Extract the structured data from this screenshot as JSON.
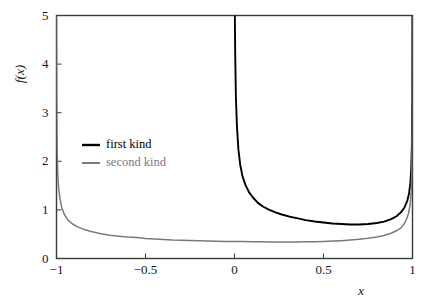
{
  "chart_data": {
    "type": "line",
    "title": "",
    "xlabel": "x",
    "ylabel": "f(x)",
    "xlim": [
      -1,
      1
    ],
    "ylim": [
      0,
      5
    ],
    "xticks": [
      "-1",
      "-0.5",
      "0",
      "0.5",
      "1"
    ],
    "xtick_values": [
      -1,
      -0.5,
      0,
      0.5,
      1
    ],
    "yticks": [
      "0",
      "1",
      "2",
      "3",
      "4",
      "5"
    ],
    "ytick_values": [
      0,
      1,
      2,
      3,
      4,
      5
    ],
    "grid": false,
    "legend_position": "center-left",
    "series": [
      {
        "name": "first kind",
        "color": "#000000",
        "domain": [
          0,
          1
        ],
        "note": "vertical asymptote at x=0 and x=1, minimum about 0.63 near x=0.5",
        "x": [
          0.002,
          0.004,
          0.008,
          0.014,
          0.022,
          0.032,
          0.045,
          0.062,
          0.082,
          0.105,
          0.13,
          0.16,
          0.19,
          0.23,
          0.27,
          0.31,
          0.35,
          0.4,
          0.45,
          0.5,
          0.55,
          0.6,
          0.65,
          0.7,
          0.75,
          0.8,
          0.84,
          0.88,
          0.91,
          0.935,
          0.955,
          0.97,
          0.98,
          0.988,
          0.993,
          0.9965,
          0.9985,
          0.9995
        ],
        "y": [
          5.0,
          4.2,
          3.3,
          2.7,
          2.24,
          1.93,
          1.69,
          1.51,
          1.36,
          1.25,
          1.15,
          1.07,
          1.01,
          0.95,
          0.9,
          0.86,
          0.83,
          0.79,
          0.76,
          0.74,
          0.72,
          0.71,
          0.7,
          0.7,
          0.71,
          0.73,
          0.76,
          0.81,
          0.87,
          0.95,
          1.05,
          1.18,
          1.33,
          1.55,
          1.85,
          2.35,
          3.3,
          5.0
        ]
      },
      {
        "name": "second kind",
        "color": "#7a7a7a",
        "domain": [
          -1,
          1
        ],
        "note": "vertical asymptote at x=-1 and x=1, minimum about 0.33 near x=0.3",
        "x": [
          -0.9995,
          -0.9985,
          -0.9965,
          -0.993,
          -0.988,
          -0.98,
          -0.97,
          -0.955,
          -0.935,
          -0.91,
          -0.88,
          -0.84,
          -0.8,
          -0.75,
          -0.7,
          -0.65,
          -0.6,
          -0.55,
          -0.5,
          -0.45,
          -0.4,
          -0.35,
          -0.3,
          -0.25,
          -0.2,
          -0.15,
          -0.1,
          -0.05,
          0.0,
          0.05,
          0.1,
          0.15,
          0.2,
          0.25,
          0.3,
          0.35,
          0.4,
          0.45,
          0.5,
          0.55,
          0.6,
          0.65,
          0.7,
          0.75,
          0.8,
          0.84,
          0.88,
          0.91,
          0.935,
          0.955,
          0.97,
          0.98,
          0.988,
          0.993,
          0.9965,
          0.9985,
          0.9995
        ],
        "y": [
          5.0,
          3.3,
          2.3,
          1.75,
          1.45,
          1.22,
          1.04,
          0.9,
          0.79,
          0.71,
          0.65,
          0.59,
          0.55,
          0.51,
          0.48,
          0.46,
          0.44,
          0.43,
          0.41,
          0.4,
          0.39,
          0.38,
          0.375,
          0.37,
          0.365,
          0.36,
          0.355,
          0.352,
          0.35,
          0.348,
          0.345,
          0.343,
          0.342,
          0.341,
          0.341,
          0.342,
          0.344,
          0.347,
          0.352,
          0.358,
          0.367,
          0.379,
          0.394,
          0.415,
          0.443,
          0.475,
          0.52,
          0.57,
          0.63,
          0.72,
          0.84,
          0.96,
          1.15,
          1.4,
          1.85,
          2.8,
          5.0
        ]
      }
    ]
  },
  "axes": {
    "ylabel_text": "f(x)",
    "xlabel_text": "x"
  },
  "legend": {
    "entries": [
      {
        "label": "first kind",
        "color": "#000000"
      },
      {
        "label": "second kind",
        "color": "#7a7a7a"
      }
    ]
  },
  "style": {
    "frame_color": "#3a3a3a",
    "background": "#ffffff",
    "first_kind_color": "#000000",
    "second_kind_color": "#7a7a7a"
  }
}
